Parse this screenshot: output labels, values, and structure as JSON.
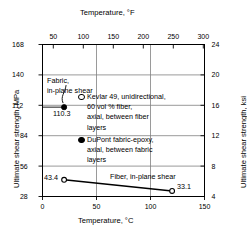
{
  "chart_data": {
    "type": "line",
    "title": "",
    "top_axis": {
      "label": "Temperature, °F",
      "ticks": [
        50,
        100,
        150,
        200,
        250,
        300
      ],
      "lim": [
        32,
        302
      ]
    },
    "bottom_axis": {
      "label": "Temperature, °C",
      "ticks": [
        0,
        50,
        100,
        150
      ],
      "lim": [
        0,
        150
      ]
    },
    "left_axis": {
      "label": "Ultimate shear strength, MPa",
      "ticks": [
        28,
        56,
        84,
        112,
        140,
        168
      ],
      "lim": [
        28,
        168
      ]
    },
    "right_axis": {
      "label": "Ultimate shear strength, ksi",
      "ticks": [
        4,
        8,
        12,
        16,
        20,
        24
      ],
      "lim": [
        4,
        24
      ]
    },
    "grid": true,
    "series": [
      {
        "name": "Fiber, in-plane shear",
        "marker": "open-circle",
        "style": "line",
        "x": [
          20,
          120
        ],
        "y": [
          43.4,
          33.1
        ],
        "point_labels": [
          "43.4",
          "33.1"
        ]
      },
      {
        "name": "Fabric, in-plane shear",
        "marker": "filled-circle",
        "style": "point",
        "x": [
          20
        ],
        "y": [
          110.3
        ],
        "point_labels": [
          "110.3"
        ]
      }
    ],
    "annotations": [
      {
        "name": "fabric-annotation",
        "text_lines": [
          "Fabric,",
          "in-plane shear"
        ],
        "points_to": {
          "x": 20,
          "y": 110.3
        }
      },
      {
        "name": "fiber-annotation",
        "text_lines": [
          "Fiber, in-plane shear"
        ]
      }
    ],
    "legend": {
      "position": "inside-center",
      "entries": [
        {
          "marker": "open-circle",
          "lines": [
            "Kevlar 49, unidirectional,",
            "60 vol % fiber,",
            "axial, between fiber",
            "layers"
          ]
        },
        {
          "marker": "filled-circle",
          "lines": [
            "DuPont fabric-epoxy,",
            "axial, between fabric",
            "layers"
          ]
        }
      ]
    },
    "colors": {
      "line": "#000000",
      "frame": "#000000",
      "grid": "#808080",
      "text": "#000000",
      "background": "#ffffff"
    }
  }
}
